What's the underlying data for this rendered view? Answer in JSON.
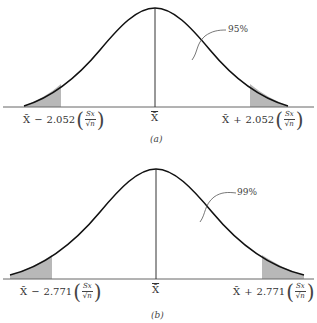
{
  "figure_a": {
    "caption": "(a)",
    "center_label": "X̄",
    "area_label": "95%",
    "left_label": {
      "mean": "X̄",
      "op": "−",
      "coef": "2.052",
      "num": "Sx",
      "den": "√n"
    },
    "right_label": {
      "mean": "X̄",
      "op": "+",
      "coef": "2.052",
      "num": "Sx",
      "den": "√n"
    }
  },
  "figure_b": {
    "caption": "(b)",
    "center_label": "X̄",
    "area_label": "99%",
    "left_label": {
      "mean": "X̄",
      "op": "−",
      "coef": "2.771",
      "num": "Sx",
      "den": "√n"
    },
    "right_label": {
      "mean": "X̄",
      "op": "+",
      "coef": "2.771",
      "num": "Sx",
      "den": "√n"
    }
  },
  "colors": {
    "shade": "#b8b8b8",
    "curve": "#111111",
    "axis": "#444444"
  }
}
